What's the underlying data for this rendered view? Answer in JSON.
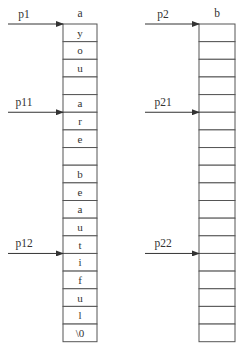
{
  "arrays": [
    {
      "name": "a",
      "cells": [
        "y",
        "o",
        "u",
        "",
        "a",
        "r",
        "e",
        "",
        "b",
        "e",
        "a",
        "u",
        "t",
        "i",
        "f",
        "u",
        "l",
        "\\0"
      ],
      "pointers": [
        {
          "label": "p1",
          "index": 0
        },
        {
          "label": "p11",
          "index": 5
        },
        {
          "label": "p12",
          "index": 13
        }
      ]
    },
    {
      "name": "b",
      "cells": [
        "",
        "",
        "",
        "",
        "",
        "",
        "",
        "",
        "",
        "",
        "",
        "",
        "",
        "",
        "",
        "",
        "",
        ""
      ],
      "pointers": [
        {
          "label": "p2",
          "index": 0
        },
        {
          "label": "p21",
          "index": 5
        },
        {
          "label": "p22",
          "index": 13
        }
      ]
    }
  ]
}
